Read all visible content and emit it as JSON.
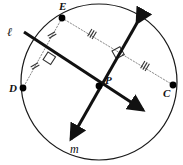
{
  "figure": {
    "type": "geometry-diagram",
    "canvas": {
      "width": 183,
      "height": 165,
      "background": "#ffffff"
    },
    "stroke_colors": {
      "circle": "#1a1a1a",
      "solid_line": "#111111",
      "dotted_chord": "#8a8a8a",
      "tick_mark": "#333333",
      "right_angle": "#333333",
      "point_fill": "#000000"
    }
  },
  "circle": {
    "name": "circle-outline",
    "cx": 99,
    "cy": 82,
    "r": 78,
    "stroke_width": 1.2
  },
  "points": [
    {
      "id": "E",
      "label": "E",
      "x": 62,
      "y": 18,
      "label_x": 59,
      "label_y": 10,
      "radius": 3.4
    },
    {
      "id": "D",
      "label": "D",
      "x": 23,
      "y": 88,
      "label_x": 9,
      "label_y": 92,
      "radius": 3.4
    },
    {
      "id": "C",
      "label": "C",
      "x": 173,
      "y": 85,
      "label_x": 163,
      "label_y": 97,
      "radius": 3.4
    },
    {
      "id": "P",
      "label": "P",
      "x": 99,
      "y": 86,
      "label_x": 105,
      "label_y": 84,
      "radius": 3.4
    }
  ],
  "lines": [
    {
      "id": "line-l",
      "label": "ℓ",
      "label_x": 7,
      "label_y": 36,
      "description": "solid line l through P with arrowhead at lower right",
      "x1": 24,
      "y1": 32,
      "x2": 143,
      "y2": 110,
      "stroke_width": 3.0,
      "arrow_at": "end"
    },
    {
      "id": "line-m",
      "label": "m",
      "label_x": 70,
      "label_y": 153,
      "description": "solid line m through P with arrowheads at top right and bottom left",
      "x1": 137,
      "y1": 23,
      "x2": 71,
      "y2": 139,
      "stroke_width": 3.0,
      "arrow_at": "both"
    }
  ],
  "chords": [
    {
      "id": "chord-EC",
      "label": "E to C",
      "style": "dotted",
      "x1": 62,
      "y1": 18,
      "x2": 173,
      "y2": 85,
      "stroke_width": 1.0
    },
    {
      "id": "chord-ED",
      "label": "E to D",
      "style": "dotted",
      "x1": 62,
      "y1": 18,
      "x2": 23,
      "y2": 88,
      "stroke_width": 1.0
    }
  ],
  "tick_marks": [
    {
      "id": "tick-EC-upper",
      "on_chord": "chord-EC",
      "count": 3,
      "x": 92,
      "y": 34,
      "angle_deg": 31,
      "label": "triple-tick-E-to-mid"
    },
    {
      "id": "tick-EC-lower",
      "on_chord": "chord-EC",
      "count": 3,
      "x": 145,
      "y": 66,
      "angle_deg": 31,
      "label": "triple-tick-mid-to-C"
    },
    {
      "id": "tick-ED-upper",
      "on_chord": "chord-ED",
      "count": 2,
      "x": 52,
      "y": 35,
      "angle_deg": 61,
      "label": "double-tick-E-to-mid"
    },
    {
      "id": "tick-ED-lower",
      "on_chord": "chord-ED",
      "count": 2,
      "x": 35,
      "y": 66,
      "angle_deg": 61,
      "label": "double-tick-mid-to-D"
    }
  ],
  "right_angles": [
    {
      "id": "right-angle-left",
      "x": 48,
      "y": 52,
      "angle_deg": 33,
      "size": 9,
      "label": "right-angle-marker-line-l-chord-ED"
    },
    {
      "id": "right-angle-right",
      "x": 112,
      "y": 51,
      "angle_deg": -29,
      "size": 9,
      "label": "right-angle-marker-line-m-chord-EC"
    }
  ],
  "legend": {
    "note": "Chord ED is bisected perpendicularly by line l; chord EC is bisected perpendicularly by line m; the two lines meet at P."
  }
}
